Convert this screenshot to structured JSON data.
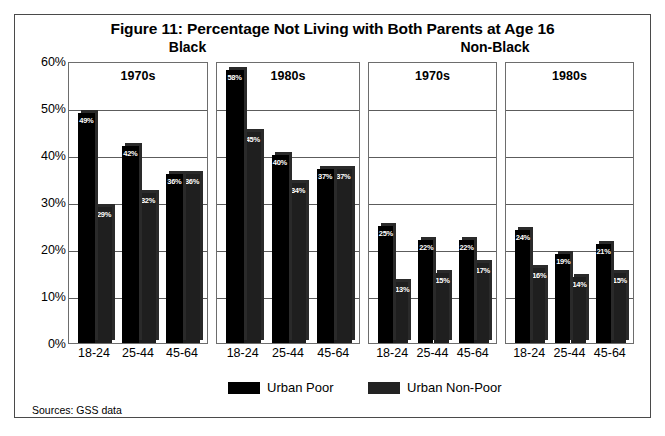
{
  "figure": {
    "title": "Figure 11:  Percentage Not Living with Both Parents at Age 16",
    "group_headings": [
      "Black",
      "Non-Black"
    ],
    "sources": "Sources: GSS data"
  },
  "legend": {
    "items": [
      {
        "label": "Urban Poor",
        "color": "#000000"
      },
      {
        "label": "Urban Non-Poor",
        "color": "#232323"
      }
    ]
  },
  "axis": {
    "y_ticks": [
      "60%",
      "50%",
      "40%",
      "30%",
      "20%",
      "10%",
      "0%"
    ],
    "x_categories": [
      "18-24",
      "25-44",
      "45-64"
    ]
  },
  "chart_data": {
    "type": "bar",
    "title": "Figure 11:  Percentage Not Living with Both Parents at Age 16",
    "xlabel": "",
    "ylabel": "",
    "ylim": [
      0,
      60
    ],
    "ytick_step": 10,
    "grid": true,
    "legend_position": "bottom",
    "categories": [
      "18-24",
      "25-44",
      "45-64"
    ],
    "panel_groups": [
      {
        "race": "Black",
        "decade": "1970s"
      },
      {
        "race": "Black",
        "decade": "1980s"
      },
      {
        "race": "Non-Black",
        "decade": "1970s"
      },
      {
        "race": "Non-Black",
        "decade": "1980s"
      }
    ],
    "panels": [
      {
        "race": "Black",
        "decade": "1970s",
        "series": [
          {
            "name": "Urban Poor",
            "values": [
              49,
              42,
              36
            ],
            "labels": [
              "49%",
              "42%",
              "36%"
            ]
          },
          {
            "name": "Urban Non-Poor",
            "values": [
              29,
              32,
              36
            ],
            "labels": [
              "29%",
              "32%",
              "36%"
            ]
          }
        ]
      },
      {
        "race": "Black",
        "decade": "1980s",
        "series": [
          {
            "name": "Urban Poor",
            "values": [
              58,
              40,
              37
            ],
            "labels": [
              "58%",
              "40%",
              "37%"
            ]
          },
          {
            "name": "Urban Non-Poor",
            "values": [
              45,
              34,
              37
            ],
            "labels": [
              "45%",
              "34%",
              "37%"
            ]
          }
        ]
      },
      {
        "race": "Non-Black",
        "decade": "1970s",
        "series": [
          {
            "name": "Urban Poor",
            "values": [
              25,
              22,
              22
            ],
            "labels": [
              "25%",
              "22%",
              "22%"
            ]
          },
          {
            "name": "Urban Non-Poor",
            "values": [
              13,
              15,
              17
            ],
            "labels": [
              "13%",
              "15%",
              "17%"
            ]
          }
        ]
      },
      {
        "race": "Non-Black",
        "decade": "1980s",
        "series": [
          {
            "name": "Urban Poor",
            "values": [
              24,
              19,
              21
            ],
            "labels": [
              "24%",
              "19%",
              "21%"
            ]
          },
          {
            "name": "Urban Non-Poor",
            "values": [
              16,
              14,
              15
            ],
            "labels": [
              "16%",
              "14%",
              "15%"
            ]
          }
        ]
      }
    ]
  },
  "layout": {
    "panel_lefts": [
      0,
      148,
      300,
      437
    ],
    "panel_widths": [
      140,
      144,
      129,
      129
    ]
  }
}
